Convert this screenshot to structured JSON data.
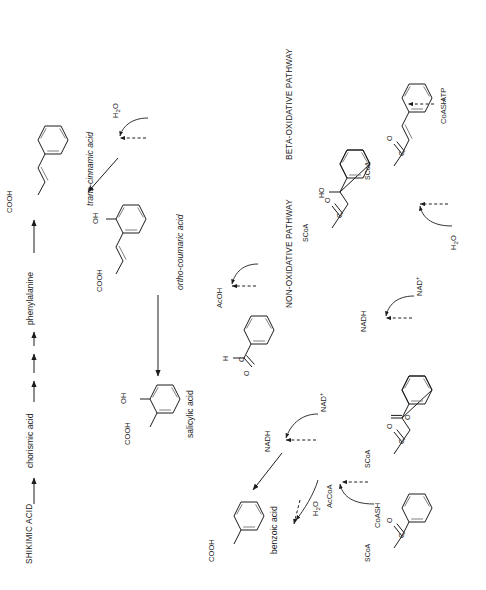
{
  "figure": {
    "kind": "biosynthetic-pathway-diagram",
    "orientation_note": "diagram content is rotated 90 degrees counter-clockwise within the image",
    "pathway_labels": [
      "NON-OXIDATIVE PATHWAY",
      "BETA-OXIDATIVE PATHWAY"
    ],
    "compounds": [
      {
        "id": "shikimic",
        "name": "SHIKIMIC ACID",
        "style": "caps"
      },
      {
        "id": "chorismic",
        "name": "chorismic acid",
        "style": "normal"
      },
      {
        "id": "phenylalanine",
        "name": "phenylalanine",
        "style": "normal"
      },
      {
        "id": "cinnamic",
        "name": "trans-cinnamic acid",
        "style": "italic-prefix"
      },
      {
        "id": "coumaric",
        "name": "ortho-coumaric acid",
        "style": "italic-prefix"
      },
      {
        "id": "salicylic",
        "name": "salicylic acid",
        "style": "normal"
      },
      {
        "id": "benzoic",
        "name": "benzoic acid",
        "style": "normal"
      }
    ],
    "structure_atom_labels": {
      "salicylic_acid": [
        "COOH",
        "OH"
      ],
      "ortho_coumaric_acid": [
        "COOH",
        "OH"
      ],
      "cinnamic_acid": [
        "COOH"
      ],
      "benzoic_acid": [
        "COOH"
      ],
      "benzaldehyde": [
        "O",
        "C",
        "H"
      ],
      "cinnamoyl_coa": [
        "SCoA",
        "C",
        "O"
      ],
      "hydroxyphenylpropionyl_coa": [
        "SCoA",
        "C",
        "O",
        "HO"
      ],
      "benzoylacetyl_coa": [
        "SCoA",
        "C",
        "O",
        "SCoA",
        "O"
      ],
      "benzoyl_coa": [
        "SCoA",
        "C",
        "O"
      ]
    },
    "cofactors": [
      {
        "id": "h2o-a",
        "text": "H2O",
        "html": "H<sub>2</sub>O"
      },
      {
        "id": "h2o-b",
        "text": "H2O",
        "html": "H<sub>2</sub>O"
      },
      {
        "id": "h2o-c",
        "text": "H2O",
        "html": "H<sub>2</sub>O"
      },
      {
        "id": "nad-a",
        "text": "NAD+",
        "html": "NAD<sup>+</sup>"
      },
      {
        "id": "nadh-a",
        "text": "NADH",
        "html": "NADH"
      },
      {
        "id": "nad-b",
        "text": "NAD+",
        "html": "NAD<sup>+</sup>"
      },
      {
        "id": "nadh-b",
        "text": "NADH",
        "html": "NADH"
      },
      {
        "id": "acoh",
        "text": "AcOH",
        "html": "AcOH"
      },
      {
        "id": "coash-a",
        "text": "CoASH",
        "html": "CoASH"
      },
      {
        "id": "accoa",
        "text": "AcCoA",
        "html": "AcCoA"
      },
      {
        "id": "coash-b",
        "text": "CoASH",
        "html": "CoASH"
      },
      {
        "id": "atp",
        "text": "ATP",
        "html": "ATP"
      }
    ],
    "colors": {
      "ink": "#1c1c1c",
      "bond_shadow": "#6f6f6f",
      "background": "#ffffff"
    }
  }
}
